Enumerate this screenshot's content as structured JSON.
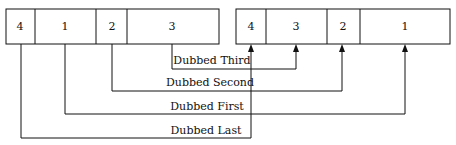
{
  "source_blocks": [
    "4",
    "1",
    "2",
    "3"
  ],
  "target_blocks": [
    "4",
    "3",
    "2",
    "1"
  ],
  "connections": [
    {
      "label": "Dubbed Third",
      "from": "3",
      "to": "3"
    },
    {
      "label": "Dubbed Second",
      "from": "2",
      "to": "2"
    },
    {
      "label": "Dubbed First",
      "from": "1",
      "to": "1"
    },
    {
      "label": "Dubbed Last",
      "from": "4",
      "to": "4"
    }
  ],
  "colors": {
    "line": "#111111",
    "background": "#ffffff"
  }
}
